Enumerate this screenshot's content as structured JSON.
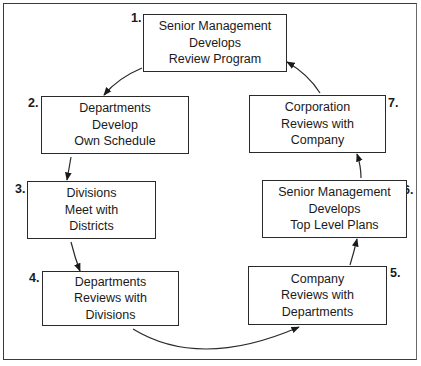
{
  "diagram": {
    "type": "cyclic-process-flow",
    "steps": [
      {
        "number": "1.",
        "lines": [
          "Senior Management",
          "Develops",
          "Review Program"
        ]
      },
      {
        "number": "2.",
        "lines": [
          "Departments",
          "Develop",
          "Own Schedule"
        ]
      },
      {
        "number": "3.",
        "lines": [
          "Divisions",
          "Meet with",
          "Districts"
        ]
      },
      {
        "number": "4.",
        "lines": [
          "Departments",
          "Reviews with",
          "Divisions"
        ]
      },
      {
        "number": "5.",
        "lines": [
          "Company",
          "Reviews with",
          "Departments"
        ]
      },
      {
        "number": "6.",
        "lines": [
          "Senior Management",
          "Develops",
          "Top Level Plans"
        ]
      },
      {
        "number": "7.",
        "lines": [
          "Corporation",
          "Reviews with",
          "Company"
        ]
      }
    ],
    "edges": [
      {
        "from": "1.",
        "to": "2."
      },
      {
        "from": "2.",
        "to": "3."
      },
      {
        "from": "3.",
        "to": "4."
      },
      {
        "from": "4.",
        "to": "5."
      },
      {
        "from": "5.",
        "to": "6."
      },
      {
        "from": "6.",
        "to": "7."
      },
      {
        "from": "7.",
        "to": "1."
      }
    ],
    "colors": {
      "line": "#2a2a2a",
      "background": "#ffffff"
    }
  }
}
